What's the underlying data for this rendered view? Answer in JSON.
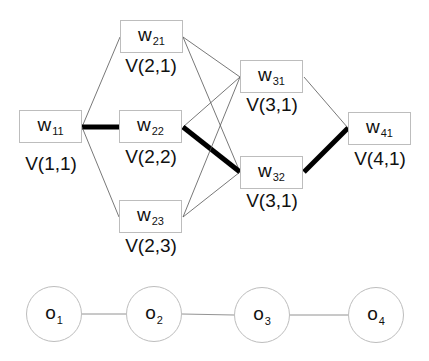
{
  "diagram": {
    "type": "trellis / viterbi lattice",
    "colors": {
      "thin_edge": "#555555",
      "bold_edge": "#000000",
      "box_border": "#bdbdbd",
      "text": "#111111"
    },
    "states": [
      {
        "id": "w11",
        "base": "w",
        "sub": "11",
        "value_label": "V(1,1)"
      },
      {
        "id": "w21",
        "base": "w",
        "sub": "21",
        "value_label": "V(2,1)"
      },
      {
        "id": "w22",
        "base": "w",
        "sub": "22",
        "value_label": "V(2,2)"
      },
      {
        "id": "w23",
        "base": "w",
        "sub": "23",
        "value_label": "V(2,3)"
      },
      {
        "id": "w31",
        "base": "w",
        "sub": "31",
        "value_label": "V(3,1)"
      },
      {
        "id": "w32",
        "base": "w",
        "sub": "32",
        "value_label": "V(3,1)"
      },
      {
        "id": "w41",
        "base": "w",
        "sub": "41",
        "value_label": "V(4,1)"
      }
    ],
    "edges": [
      {
        "from": "w11",
        "to": "w21",
        "bold": false
      },
      {
        "from": "w11",
        "to": "w22",
        "bold": true
      },
      {
        "from": "w11",
        "to": "w23",
        "bold": false
      },
      {
        "from": "w21",
        "to": "w31",
        "bold": false
      },
      {
        "from": "w21",
        "to": "w32",
        "bold": false
      },
      {
        "from": "w22",
        "to": "w31",
        "bold": false
      },
      {
        "from": "w22",
        "to": "w32",
        "bold": true
      },
      {
        "from": "w23",
        "to": "w31",
        "bold": false
      },
      {
        "from": "w23",
        "to": "w32",
        "bold": false
      },
      {
        "from": "w31",
        "to": "w41",
        "bold": false
      },
      {
        "from": "w32",
        "to": "w41",
        "bold": true
      }
    ],
    "observations": [
      {
        "id": "o1",
        "base": "o",
        "sub": "1"
      },
      {
        "id": "o2",
        "base": "o",
        "sub": "2"
      },
      {
        "id": "o3",
        "base": "o",
        "sub": "3"
      },
      {
        "id": "o4",
        "base": "o",
        "sub": "4"
      }
    ],
    "observation_edges": [
      {
        "from": "o1",
        "to": "o2"
      },
      {
        "from": "o2",
        "to": "o3"
      },
      {
        "from": "o3",
        "to": "o4"
      }
    ]
  }
}
